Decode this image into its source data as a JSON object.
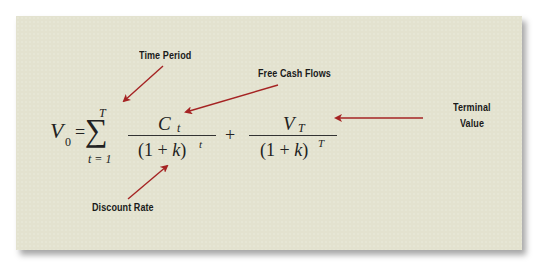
{
  "labels": {
    "time_period": "Time Period",
    "free_cash_flows": "Free Cash Flows",
    "terminal_value_line1": "Terminal",
    "terminal_value_line2": "Value",
    "discount_rate": "Discount Rate"
  },
  "formula": {
    "lhs_var": "V",
    "lhs_sub": "0",
    "equals": "=",
    "sum_symbol": "∑",
    "sum_upper": "T",
    "sum_lower": "t = 1",
    "term1_num_var": "C",
    "term1_num_sub": "t",
    "term1_den_open": "(1 + ",
    "term1_den_k": "k",
    "term1_den_close": ")",
    "term1_den_exp": "t",
    "plus": "+",
    "term2_num_var": "V",
    "term2_num_sub": "T",
    "term2_den_open": "(1 + ",
    "term2_den_k": "k",
    "term2_den_close": ")",
    "term2_den_exp": "T"
  },
  "colors": {
    "panel_bg": "#e3e2cf",
    "arrow": "#a52323",
    "text": "#1a1a1a"
  }
}
